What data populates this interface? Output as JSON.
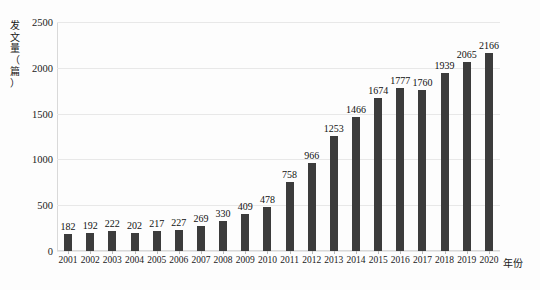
{
  "chart_data": {
    "type": "bar",
    "title": "",
    "xlabel": "年份",
    "ylabel": "发文量（篇）",
    "categories": [
      "2001",
      "2002",
      "2003",
      "2004",
      "2005",
      "2006",
      "2007",
      "2008",
      "2009",
      "2010",
      "2011",
      "2012",
      "2013",
      "2014",
      "2015",
      "2016",
      "2017",
      "2018",
      "2019",
      "2020"
    ],
    "values": [
      182,
      192,
      222,
      202,
      217,
      227,
      269,
      330,
      409,
      478,
      758,
      966,
      1253,
      1466,
      1674,
      1777,
      1760,
      1939,
      2065,
      2166
    ],
    "ylim": [
      0,
      2500
    ],
    "yticks": [
      0,
      500,
      1000,
      1500,
      2000,
      2500
    ],
    "ytick_labels": [
      "0",
      "500",
      "1000",
      "1500",
      "2000",
      "2500"
    ],
    "grid": true,
    "legend": "none",
    "show_data_labels": true,
    "bar_color": "#3c3c3c",
    "gridline_color": "#e8e8e8",
    "background_color": "#fdfdfd",
    "text_color": "#1a1a1a"
  }
}
